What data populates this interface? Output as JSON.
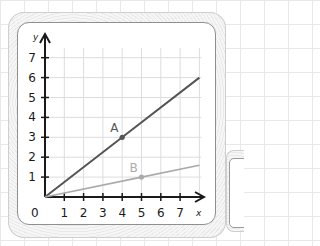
{
  "chart_data": {
    "type": "line",
    "title": "",
    "xlabel": "x",
    "ylabel": "y",
    "origin_label": "0",
    "xlim": [
      0,
      8
    ],
    "ylim": [
      0,
      7.5
    ],
    "x_ticks": [
      "1",
      "2",
      "3",
      "4",
      "5",
      "6",
      "7"
    ],
    "y_ticks": [
      "1",
      "2",
      "3",
      "4",
      "5",
      "6",
      "7"
    ],
    "grid": true,
    "series": [
      {
        "name": "A",
        "color": "#555555",
        "x": [
          0,
          4,
          8
        ],
        "y": [
          0,
          3,
          6
        ],
        "marked_point": {
          "label": "A",
          "x": 4,
          "y": 3
        }
      },
      {
        "name": "B",
        "color": "#aaaaaa",
        "x": [
          0,
          5,
          8
        ],
        "y": [
          0,
          1,
          1.6
        ],
        "marked_point": {
          "label": "B",
          "x": 5,
          "y": 1
        }
      }
    ]
  },
  "colors": {
    "axis": "#1a1a1a",
    "grid": "#dddddd",
    "card_border": "#8f8f8f"
  }
}
